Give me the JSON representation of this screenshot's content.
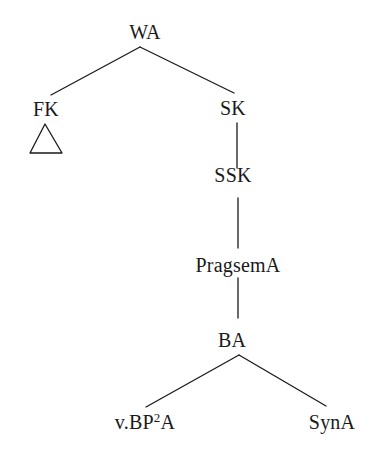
{
  "diagram": {
    "type": "syntax-tree",
    "nodes": {
      "root": {
        "label": "WA"
      },
      "fk": {
        "label": "FK",
        "collapsed_subtree": true
      },
      "sk": {
        "label": "SK"
      },
      "ssk": {
        "label": "SSK"
      },
      "pragsem": {
        "label": "PragsemA"
      },
      "ba": {
        "label": "BA"
      },
      "vbp": {
        "label_prefix": "v.BP",
        "label_superscript": "2",
        "label_suffix": "A"
      },
      "syn": {
        "label": "SynA"
      }
    },
    "edges": [
      [
        "WA",
        "FK"
      ],
      [
        "WA",
        "SK"
      ],
      [
        "SK",
        "SSK"
      ],
      [
        "SSK",
        "PragsemA"
      ],
      [
        "PragsemA",
        "BA"
      ],
      [
        "BA",
        "v.BP2A"
      ],
      [
        "BA",
        "SynA"
      ]
    ],
    "caption_partial": "(text cut off at bottom edge)"
  }
}
